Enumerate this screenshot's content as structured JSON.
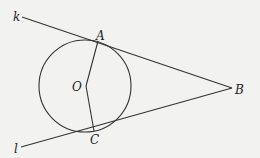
{
  "diagram": {
    "labels": {
      "k": "k",
      "l": "l",
      "A": "A",
      "B": "B",
      "C": "C",
      "O": "O"
    },
    "colors": {
      "background": "#f2f2f0",
      "stroke": "#333333"
    }
  }
}
